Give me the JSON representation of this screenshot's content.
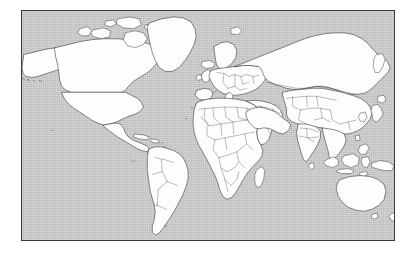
{
  "figure": {
    "type": "locator-map",
    "projection": "rectangular world map",
    "title": "",
    "caption": "",
    "background_color": "#ffffff"
  },
  "map": {
    "frame": {
      "border_color": "#3a3a3a",
      "x": 21,
      "y": 10,
      "width": 374,
      "height": 231
    },
    "ocean": {
      "label": "ocean",
      "color": "#bdbdbd",
      "texture": "dithered gray"
    },
    "land": {
      "label": "land",
      "fill_color": "#fdfdfd",
      "outline_color": "#2b2b2b"
    },
    "country_borders": {
      "label": "country borders",
      "color": "#4a4a4a",
      "visible": "true"
    },
    "highlight": {
      "label": "Iran",
      "fill_color": "#1a1a1a",
      "description": "highlighted country shown in solid black"
    },
    "regions": [
      {
        "name": "North America"
      },
      {
        "name": "South America"
      },
      {
        "name": "Greenland"
      },
      {
        "name": "Europe"
      },
      {
        "name": "Africa"
      },
      {
        "name": "Asia"
      },
      {
        "name": "Russia"
      },
      {
        "name": "India"
      },
      {
        "name": "Southeast Asia"
      },
      {
        "name": "Australia"
      },
      {
        "name": "New Zealand"
      },
      {
        "name": "Japan"
      },
      {
        "name": "Iceland"
      },
      {
        "name": "Madagascar"
      }
    ]
  }
}
